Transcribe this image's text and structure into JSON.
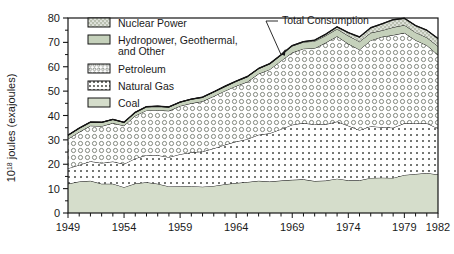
{
  "chart_data": {
    "type": "area",
    "title": "",
    "subtitle": "",
    "xlabel": "",
    "ylabel": "10¹⁸ joules (exajoules)",
    "ylabel_base": "10",
    "ylabel_exp": "18",
    "ylabel_rest": " joules (exajoules)",
    "stacked": true,
    "grid": false,
    "legend_position": "top-left-inside",
    "xlim": [
      1949,
      1982
    ],
    "ylim": [
      0,
      80
    ],
    "yticks": [
      0,
      10,
      20,
      30,
      40,
      50,
      60,
      70,
      80
    ],
    "ytick_labels": [
      "0",
      "10",
      "20",
      "30",
      "40",
      "50",
      "60",
      "70",
      "80"
    ],
    "yminor_step": 5,
    "xticks": [
      1949,
      1950,
      1951,
      1952,
      1953,
      1954,
      1955,
      1956,
      1957,
      1958,
      1959,
      1960,
      1961,
      1962,
      1963,
      1964,
      1965,
      1966,
      1967,
      1968,
      1969,
      1970,
      1971,
      1972,
      1973,
      1974,
      1975,
      1976,
      1977,
      1978,
      1979,
      1980,
      1981,
      1982
    ],
    "xtick_labels": [
      "1949",
      "1954",
      "1959",
      "1964",
      "1969",
      "1974",
      "1979",
      "1982"
    ],
    "xtick_labeled_years": [
      1949,
      1954,
      1959,
      1964,
      1969,
      1974,
      1979,
      1982
    ],
    "x": [
      1949,
      1950,
      1951,
      1952,
      1953,
      1954,
      1955,
      1956,
      1957,
      1958,
      1959,
      1960,
      1961,
      1962,
      1963,
      1964,
      1965,
      1966,
      1967,
      1968,
      1969,
      1970,
      1971,
      1972,
      1973,
      1974,
      1975,
      1976,
      1977,
      1978,
      1979,
      1980,
      1981,
      1982
    ],
    "series": [
      {
        "name": "Coal",
        "pattern": "solid-green",
        "color": "#d5ddcb",
        "values": [
          12.0,
          12.9,
          13.2,
          12.0,
          12.0,
          10.6,
          12.1,
          12.6,
          12.0,
          10.9,
          11.0,
          11.0,
          10.8,
          11.1,
          11.8,
          12.3,
          12.7,
          13.2,
          12.9,
          13.3,
          13.6,
          13.8,
          13.1,
          13.3,
          14.1,
          13.4,
          13.4,
          14.4,
          14.5,
          14.4,
          15.6,
          16.0,
          16.4,
          15.8
        ]
      },
      {
        "name": "Natural Gas",
        "pattern": "dots",
        "color": "#ffffff",
        "values": [
          6.3,
          6.8,
          8.0,
          8.5,
          9.1,
          9.5,
          10.3,
          11.1,
          11.7,
          12.0,
          13.1,
          13.9,
          14.4,
          15.4,
          16.2,
          17.0,
          17.6,
          18.9,
          19.8,
          21.1,
          22.6,
          23.1,
          23.2,
          23.1,
          23.4,
          22.4,
          20.6,
          21.2,
          20.7,
          20.6,
          21.2,
          20.7,
          20.4,
          18.9
        ]
      },
      {
        "name": "Petroleum",
        "pattern": "circles",
        "color": "#ffffff",
        "values": [
          12.1,
          13.5,
          14.6,
          15.1,
          15.8,
          15.7,
          17.5,
          18.4,
          18.5,
          19.0,
          19.8,
          20.1,
          20.6,
          21.4,
          22.1,
          22.8,
          23.5,
          25.0,
          26.2,
          28.0,
          29.6,
          30.5,
          31.3,
          33.5,
          35.0,
          33.6,
          33.0,
          35.2,
          37.1,
          38.0,
          37.1,
          34.2,
          32.0,
          30.2
        ]
      },
      {
        "name": "Hydropower, Geothermal, and Other",
        "pattern": "solid-green",
        "color": "#c5d1bb",
        "values": [
          1.5,
          1.6,
          1.5,
          1.6,
          1.5,
          1.4,
          1.4,
          1.5,
          1.6,
          1.6,
          1.6,
          1.7,
          1.7,
          1.8,
          1.8,
          1.9,
          2.1,
          2.1,
          2.3,
          2.3,
          2.7,
          2.7,
          2.9,
          2.9,
          3.0,
          3.3,
          3.3,
          3.1,
          2.6,
          3.2,
          3.2,
          3.2,
          3.2,
          3.5
        ]
      },
      {
        "name": "Nuclear Power",
        "pattern": "dense-hatch",
        "color": "#b9bfb0",
        "values": [
          0.0,
          0.0,
          0.0,
          0.0,
          0.0,
          0.0,
          0.0,
          0.0,
          0.0,
          0.0,
          0.0,
          0.0,
          0.0,
          0.0,
          0.1,
          0.1,
          0.1,
          0.1,
          0.1,
          0.2,
          0.2,
          0.2,
          0.4,
          0.6,
          0.9,
          1.3,
          1.9,
          2.1,
          2.7,
          3.1,
          2.8,
          2.8,
          3.0,
          3.2
        ]
      }
    ],
    "total_series": {
      "name": "Total Consumption",
      "values": [
        31.9,
        34.8,
        37.3,
        37.2,
        38.4,
        37.2,
        41.3,
        43.6,
        43.8,
        43.5,
        45.5,
        46.7,
        47.5,
        49.7,
        52.0,
        54.1,
        56.0,
        59.3,
        61.3,
        64.9,
        68.7,
        70.3,
        70.9,
        73.4,
        76.4,
        74.0,
        72.2,
        76.0,
        77.6,
        79.3,
        79.9,
        76.9,
        75.0,
        71.6
      ]
    },
    "annotations": [
      {
        "text": "Total Consumption",
        "target_year": 1968,
        "target_value": 65.0
      }
    ],
    "legend": [
      {
        "label": "Nuclear Power",
        "pattern": "dense-hatch"
      },
      {
        "label": "Hydropower, Geothermal,",
        "label2": "and Other",
        "pattern": "solid-green"
      },
      {
        "label": "Petroleum",
        "pattern": "circles"
      },
      {
        "label": "Natural Gas",
        "pattern": "dots"
      },
      {
        "label": "Coal",
        "pattern": "solid-light"
      }
    ],
    "colors": {
      "coal": "#d5ddcb",
      "hydro": "#c5d1bb",
      "nuclear": "#b9bfb0",
      "line": "#1a1a1a",
      "axis": "#1a1a1a",
      "background": "#ffffff"
    }
  }
}
